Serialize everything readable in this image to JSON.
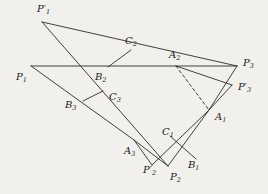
{
  "figure": {
    "background_color": "#f2f0ec",
    "stroke_color": "#2b2b2b",
    "type": "geometric-construction-diagram"
  },
  "labels": {
    "p1_prime": {
      "base": "P",
      "sub": "1",
      "prime": "′"
    },
    "p2_prime": {
      "base": "P",
      "sub": "2",
      "prime": "′"
    },
    "p3_prime": {
      "base": "P",
      "sub": "3",
      "prime": "′"
    },
    "p1": {
      "base": "P",
      "sub": "1",
      "prime": ""
    },
    "p2": {
      "base": "P",
      "sub": "2",
      "prime": ""
    },
    "p3": {
      "base": "P",
      "sub": "3",
      "prime": ""
    },
    "a1": {
      "base": "A",
      "sub": "1",
      "prime": ""
    },
    "a2": {
      "base": "A",
      "sub": "2",
      "prime": ""
    },
    "a3": {
      "base": "A",
      "sub": "3",
      "prime": ""
    },
    "b1": {
      "base": "B",
      "sub": "1",
      "prime": ""
    },
    "b2": {
      "base": "B",
      "sub": "2",
      "prime": ""
    },
    "b3": {
      "base": "B",
      "sub": "3",
      "prime": ""
    },
    "c1": {
      "base": "C",
      "sub": "1",
      "prime": ""
    },
    "c2": {
      "base": "C",
      "sub": "2",
      "prime": ""
    },
    "c3": {
      "base": "C",
      "sub": "3",
      "prime": ""
    }
  },
  "chart_data": {
    "type": "scatter",
    "title": "",
    "xlabel": "",
    "ylabel": "",
    "points": {
      "P1_prime": [
        42,
        22
      ],
      "P1": [
        31,
        66
      ],
      "P3": [
        237,
        66
      ],
      "P3_prime": [
        232,
        85
      ],
      "A1": [
        209,
        110
      ],
      "A2": [
        176,
        66
      ],
      "A3": [
        134,
        140
      ],
      "B1": [
        196,
        159
      ],
      "B2": [
        108,
        67
      ],
      "B3": [
        83,
        101
      ],
      "C1": [
        170,
        136
      ],
      "C2": [
        131,
        50
      ],
      "C3": [
        103,
        91
      ],
      "P2": [
        168,
        166
      ],
      "P2_prime": [
        152,
        165
      ]
    },
    "segments": [
      [
        "P1",
        "P3"
      ],
      [
        "P1_prime",
        "P3"
      ],
      [
        "P1_prime",
        "P2"
      ],
      [
        "P1",
        "A3"
      ],
      [
        "A3",
        "P2"
      ],
      [
        "A3",
        "P2_prime"
      ],
      [
        "P2_prime",
        "A1"
      ],
      [
        "P2",
        "A1"
      ],
      [
        "A1",
        "P3"
      ],
      [
        "P3_prime",
        "A2"
      ],
      [
        "P3_prime",
        "A1"
      ],
      [
        "C2",
        "B2"
      ],
      [
        "C3",
        "B3"
      ],
      [
        "C1",
        "B1"
      ]
    ],
    "dashed_segments": [
      [
        "A2",
        "A1"
      ]
    ]
  },
  "label_positions": {
    "p1_prime": [
      37,
      4
    ],
    "p1": [
      16,
      72
    ],
    "p3": [
      243,
      58
    ],
    "p3_prime": [
      238,
      82
    ],
    "a1": [
      215,
      112
    ],
    "a2": [
      169,
      50
    ],
    "a3": [
      124,
      146
    ],
    "b1": [
      188,
      160
    ],
    "b2": [
      95,
      72
    ],
    "b3": [
      65,
      100
    ],
    "c1": [
      162,
      127
    ],
    "c2": [
      125,
      36
    ],
    "c3": [
      109,
      92
    ],
    "p2": [
      170,
      172
    ],
    "p2_prime": [
      143,
      165
    ]
  }
}
